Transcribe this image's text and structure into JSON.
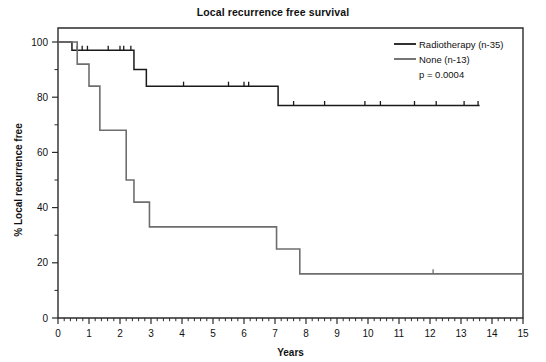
{
  "chart_data": {
    "type": "line",
    "title": "Local recurrence free survival",
    "xlabel": "Years",
    "ylabel": "% Local recurrence free",
    "xlim": [
      0,
      15
    ],
    "ylim": [
      0,
      105
    ],
    "xticks": [
      0,
      1,
      2,
      3,
      4,
      5,
      6,
      7,
      8,
      9,
      10,
      11,
      12,
      13,
      14,
      15
    ],
    "xticklabels": [
      "0",
      "1",
      "2",
      "3",
      "4",
      "5",
      "6",
      "7",
      "8",
      "9",
      "10",
      "11",
      "12",
      "13",
      "14",
      "15"
    ],
    "yticks": [
      0,
      20,
      40,
      60,
      80,
      100
    ],
    "yticklabels": [
      "0",
      "20",
      "40",
      "60",
      "80",
      "100"
    ],
    "yticks_minor": [
      10,
      30,
      50,
      70,
      90
    ],
    "grid": false,
    "legend_position": "top-right",
    "annotation_pvalue": "p = 0.0004",
    "series": [
      {
        "name": "Radiotherapy (n-35)",
        "label": "Radiotherapy (n-35)",
        "color": "#1a1a1a",
        "linewidth": 1.5,
        "steps": [
          [
            0.0,
            100
          ],
          [
            0.45,
            100
          ],
          [
            0.45,
            97
          ],
          [
            2.45,
            97
          ],
          [
            2.45,
            90
          ],
          [
            2.85,
            90
          ],
          [
            2.85,
            84
          ],
          [
            7.1,
            84
          ],
          [
            7.1,
            77
          ],
          [
            13.6,
            77
          ]
        ],
        "censor_times": [
          0.62,
          0.78,
          0.95,
          1.62,
          2.0,
          2.12,
          2.35,
          4.05,
          5.5,
          6.0,
          6.15,
          7.6,
          8.6,
          9.9,
          10.4,
          11.5,
          12.2,
          13.1,
          13.55
        ]
      },
      {
        "name": "None (n-13)",
        "label": "None (n-13)",
        "color": "#6e6e6e",
        "linewidth": 1.6,
        "steps": [
          [
            0.0,
            100
          ],
          [
            0.62,
            100
          ],
          [
            0.62,
            92
          ],
          [
            1.0,
            92
          ],
          [
            1.0,
            84
          ],
          [
            1.35,
            84
          ],
          [
            1.35,
            68
          ],
          [
            2.2,
            68
          ],
          [
            2.2,
            50
          ],
          [
            2.45,
            50
          ],
          [
            2.45,
            42
          ],
          [
            2.95,
            42
          ],
          [
            2.95,
            33
          ],
          [
            7.05,
            33
          ],
          [
            7.05,
            25
          ],
          [
            7.8,
            25
          ],
          [
            7.8,
            16
          ],
          [
            15.0,
            16
          ]
        ],
        "censor_times": [
          12.1
        ]
      }
    ]
  },
  "legend": {
    "items": [
      {
        "label": "Radiotherapy (n-35)",
        "color": "#1a1a1a"
      },
      {
        "label": "None (n-13)",
        "color": "#6e6e6e"
      }
    ],
    "pvalue": "p = 0.0004"
  },
  "axes": {
    "title": "Local recurrence free survival",
    "x_title": "Years",
    "y_title": "% Local recurrence free"
  }
}
